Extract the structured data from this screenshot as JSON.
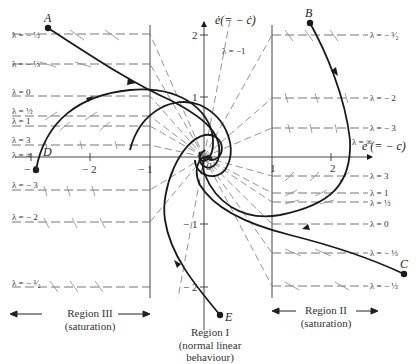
{
  "figure": {
    "axes": {
      "x_label": "e (= − c)",
      "y_label": "ė(= − ċ)",
      "origin_label": "0",
      "x_ticks": [
        "− 3",
        "− 2",
        "− 1",
        "1",
        "2"
      ],
      "y_ticks": [
        "2",
        "1",
        "− 1",
        "− 2"
      ]
    },
    "points": {
      "A": "A",
      "B": "B",
      "C": "C",
      "D": "D",
      "E": "E"
    },
    "left_isoclines": [
      "λ = − ½",
      "λ = − ⅓",
      "λ = 0",
      "λ = ½",
      "λ = 1",
      "λ = 3",
      "λ = ∞",
      "λ = − 3",
      "λ = − 2",
      "λ = − ³⁄₂"
    ],
    "right_isoclines": [
      "λ = − ³⁄₂",
      "λ = − 2",
      "λ = − 3",
      "λ = ∞",
      "λ = 3",
      "λ = 1",
      "λ = ½",
      "λ = 0",
      "λ = − ⅓",
      "λ = − ½"
    ],
    "center_isocline": "λ = −1",
    "regions": {
      "left_title": "Region III",
      "left_sub": "(saturation)",
      "center_title": "Region I",
      "center_sub1": "(normal linear",
      "center_sub2": "behaviour)",
      "right_title": "Region II",
      "right_sub": "(saturation)"
    },
    "colors": {
      "ink": "#1a1a1a",
      "grid": "#555555",
      "dash": "#666666"
    }
  }
}
